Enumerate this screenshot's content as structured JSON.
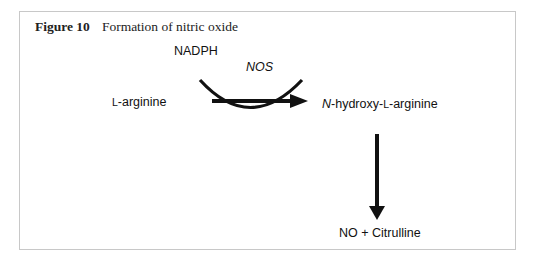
{
  "figure": {
    "number": "Figure 10",
    "title": "Formation of nitric oxide"
  },
  "diagram": {
    "cofactor": "NADPH",
    "enzyme": "NOS",
    "substrate": {
      "prefix": "L",
      "name": "-arginine"
    },
    "intermediate": {
      "italic": "N",
      "mid": "-hydroxy-",
      "prefix": "L",
      "name": "-arginine"
    },
    "product": "NO + Citrulline"
  }
}
